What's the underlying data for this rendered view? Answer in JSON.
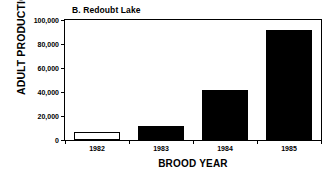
{
  "chart_data": {
    "type": "bar",
    "title": "B. Redoubt Lake",
    "xlabel": "BROOD YEAR",
    "ylabel": "ADULT PRODUCTION",
    "categories": [
      "1982",
      "1983",
      "1984",
      "1985"
    ],
    "values": [
      6500,
      11500,
      42000,
      91500
    ],
    "bar_styles": [
      "open",
      "filled",
      "filled",
      "filled"
    ],
    "ylim": [
      0,
      100000
    ],
    "ytick_values": [
      0,
      20000,
      40000,
      60000,
      80000,
      100000
    ],
    "ytick_labels": [
      "0",
      "20,000",
      "40,000",
      "60,000",
      "80,000",
      "100,000"
    ],
    "grid": false,
    "legend": null,
    "colors": {
      "axis": "#000000",
      "bar_fill": "#000000",
      "bar_open_fill": "#ffffff",
      "background": "#ffffff"
    }
  }
}
